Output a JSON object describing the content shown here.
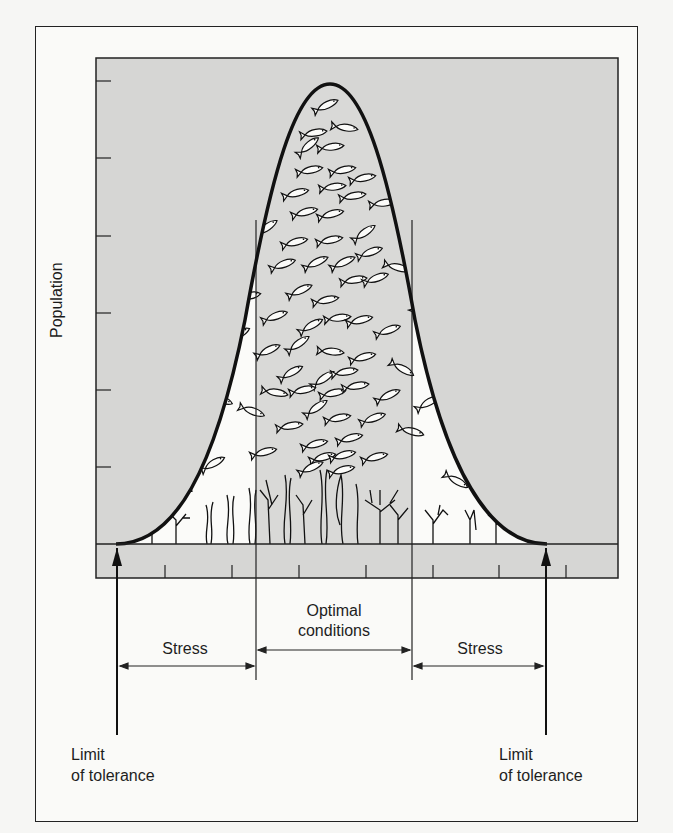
{
  "diagram": {
    "y_axis_label": "Population",
    "zones": {
      "left_stress": "Stress",
      "optimal_line1": "Optimal",
      "optimal_line2": "conditions",
      "right_stress": "Stress"
    },
    "limits": {
      "left_line1": "Limit",
      "left_line2": "of tolerance",
      "right_line1": "Limit",
      "right_line2": "of tolerance"
    },
    "colors": {
      "plot_fill": "#d6d6d4",
      "curve_interior": "#fbfbf9",
      "optimal_band": "#d9d9d7",
      "stroke": "#111111"
    },
    "icons": [
      "fish-icon",
      "seaweed-icon",
      "branching-plant-icon",
      "up-arrow-icon"
    ]
  }
}
